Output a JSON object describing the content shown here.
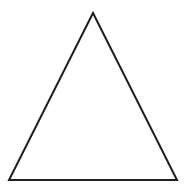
{
  "figure": {
    "name": "triangle-outline",
    "type": "geometric-shape-diagram",
    "shape_label": "triangle",
    "canvas": {
      "width": 185,
      "height": 189,
      "background_color": "#ffffff"
    },
    "style": {
      "stroke_color": "#1e1e1e",
      "stroke_width": 2,
      "fill": "none",
      "fill_color": "#ffffff",
      "line_join": "miter"
    },
    "vertices": [
      {
        "name": "apex",
        "x": 93,
        "y": 13
      },
      {
        "name": "bottom-right",
        "x": 177,
        "y": 180
      },
      {
        "name": "bottom-left",
        "x": 9,
        "y": 180
      }
    ],
    "points_attr": "93,13 177,180 9,180",
    "edges": [
      {
        "name": "left-edge",
        "from": "bottom-left",
        "to": "apex"
      },
      {
        "name": "right-edge",
        "from": "apex",
        "to": "bottom-right"
      },
      {
        "name": "base-edge",
        "from": "bottom-right",
        "to": "bottom-left"
      }
    ],
    "measurements": {
      "base_length_px": 168,
      "height_px": 167,
      "classification": "isosceles"
    }
  }
}
